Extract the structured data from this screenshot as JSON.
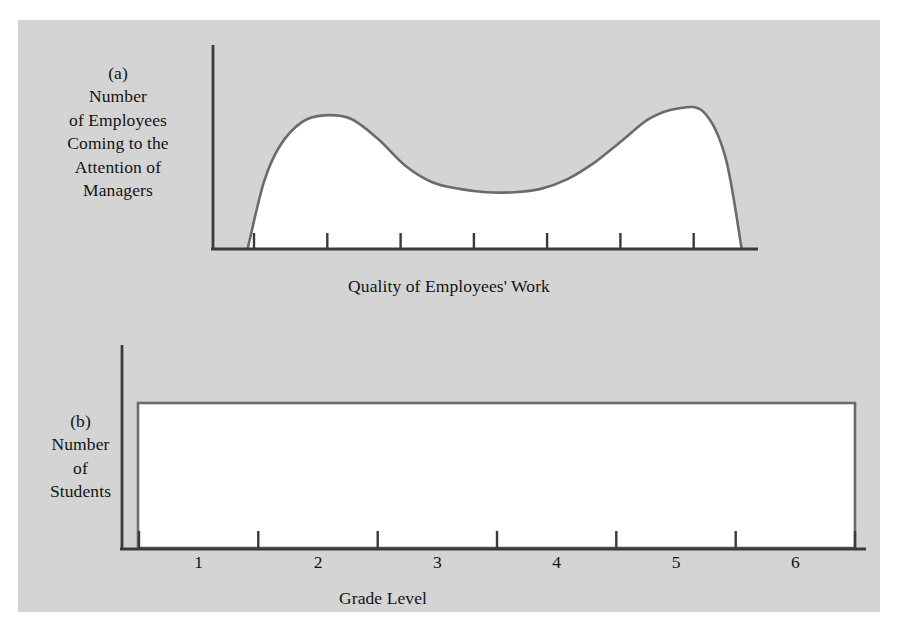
{
  "figure": {
    "background_color": "#d4d4d4",
    "plot_fill_color": "#ffffff",
    "axis_color": "#3a3a3a",
    "curve_color": "#6b6b6b",
    "text_color": "#131313"
  },
  "panel_a": {
    "tag": "(a)",
    "ylabel_lines": [
      "Number",
      "of Employees",
      "Coming to the",
      "Attention of",
      "Managers"
    ],
    "xlabel": "Quality of Employees' Work",
    "tick_count": 7
  },
  "panel_b": {
    "tag": "(b)",
    "ylabel_lines": [
      "Number",
      "of",
      "Students"
    ],
    "xlabel": "Grade Level",
    "tick_labels": [
      "1",
      "2",
      "3",
      "4",
      "5",
      "6"
    ]
  },
  "chart_data": [
    {
      "type": "area",
      "title": "",
      "panel": "(a)",
      "xlabel": "Quality of Employees' Work",
      "ylabel": "Number of Employees Coming to the Attention of Managers",
      "grid": false,
      "legend": "none",
      "xticklabels": [],
      "yticklabels": [],
      "distribution": "bimodal U-shaped (bathtub)",
      "x": [
        0.06,
        0.09,
        0.12,
        0.16,
        0.2,
        0.25,
        0.3,
        0.35,
        0.4,
        0.45,
        0.5,
        0.55,
        0.6,
        0.65,
        0.7,
        0.75,
        0.8,
        0.85,
        0.9,
        0.94,
        0.97
      ],
      "y": [
        0.0,
        0.4,
        0.62,
        0.76,
        0.8,
        0.78,
        0.66,
        0.5,
        0.4,
        0.36,
        0.34,
        0.34,
        0.36,
        0.42,
        0.52,
        0.65,
        0.78,
        0.84,
        0.82,
        0.55,
        0.0
      ],
      "xlim": [
        0,
        1
      ],
      "ylim": [
        0,
        1
      ]
    },
    {
      "type": "bar",
      "title": "",
      "panel": "(b)",
      "xlabel": "Grade Level",
      "ylabel": "Number of Students",
      "grid": false,
      "legend": "none",
      "categories": [
        "1",
        "2",
        "3",
        "4",
        "5",
        "6"
      ],
      "values": [
        1,
        1,
        1,
        1,
        1,
        1
      ],
      "distribution": "uniform / flat rectangle",
      "xlim": [
        0.5,
        6.5
      ],
      "ylim": [
        0,
        1.1
      ]
    }
  ]
}
